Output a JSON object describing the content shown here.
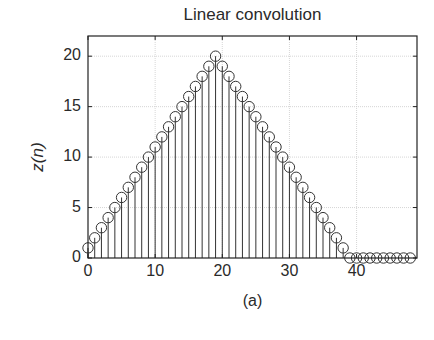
{
  "chart_data": {
    "type": "stem",
    "title": "Linear convolution",
    "xlabel": "",
    "ylabel": "z(n)",
    "caption": "(a)",
    "xlim": [
      0,
      49
    ],
    "ylim": [
      0,
      22
    ],
    "xticks": [
      0,
      10,
      20,
      30,
      40
    ],
    "yticks": [
      0,
      5,
      10,
      15,
      20
    ],
    "grid": true,
    "x": [
      0,
      1,
      2,
      3,
      4,
      5,
      6,
      7,
      8,
      9,
      10,
      11,
      12,
      13,
      14,
      15,
      16,
      17,
      18,
      19,
      20,
      21,
      22,
      23,
      24,
      25,
      26,
      27,
      28,
      29,
      30,
      31,
      32,
      33,
      34,
      35,
      36,
      37,
      38,
      39,
      40,
      41,
      42,
      43,
      44,
      45,
      46,
      47,
      48
    ],
    "values": [
      1,
      2,
      3,
      4,
      5,
      6,
      7,
      8,
      9,
      10,
      11,
      12,
      13,
      14,
      15,
      16,
      17,
      18,
      19,
      20,
      19,
      18,
      17,
      16,
      15,
      14,
      13,
      12,
      11,
      10,
      9,
      8,
      7,
      6,
      5,
      4,
      3,
      2,
      1,
      0,
      0,
      0,
      0,
      0,
      0,
      0,
      0,
      0,
      0
    ],
    "marker": "circle-open",
    "colors": {
      "stem": "#333333",
      "marker": "#333333",
      "grid": "#cccccc",
      "axes": "#222222"
    }
  }
}
